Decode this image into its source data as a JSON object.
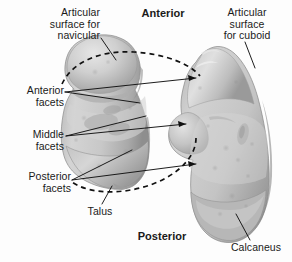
{
  "figure": {
    "background_color": "#fdfdfd",
    "text_color": "#1a1a1a",
    "leader_line_color": "#111111",
    "dashed_outline_color": "#111111"
  },
  "orientation_labels": {
    "top": "Anterior",
    "bottom": "Posterior"
  },
  "labels": {
    "articular_surface_navicular": "Articular\nsurface for\nnavicular",
    "articular_surface_cuboid": "Articular\nsurface\nfor cuboid",
    "anterior_facets": "Anterior\nfacets",
    "middle_facets": "Middle\nfacets",
    "posterior_facets": "Posterior\nfacets",
    "talus": "Talus",
    "calcaneus": "Calcaneus"
  },
  "bones": [
    {
      "name": "talus",
      "label": "Talus",
      "position": "left",
      "fill": "#c9c9c9",
      "features": [
        "articular surface for navicular",
        "anterior facets",
        "middle facets",
        "posterior facets"
      ]
    },
    {
      "name": "calcaneus",
      "label": "Calcaneus",
      "position": "right",
      "fill": "#c6c6c6",
      "features": [
        "articular surface for cuboid",
        "anterior facets",
        "middle facets",
        "posterior facets"
      ]
    }
  ],
  "annotations": {
    "dashed_ellipse": "dashed outline linking talus and calcaneus articulation",
    "leader_lines_count": 9
  }
}
